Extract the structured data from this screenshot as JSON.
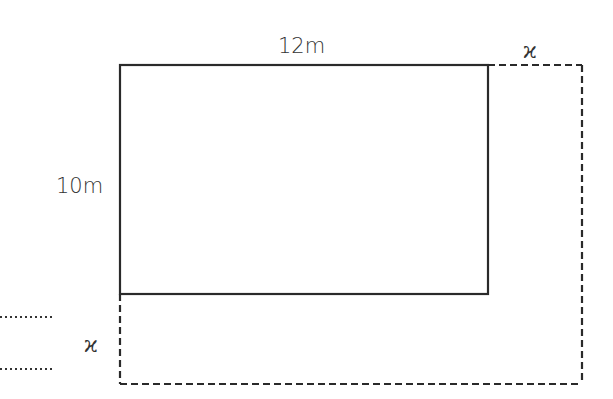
{
  "diagram": {
    "type": "area-expansion-rectangle",
    "inner_rectangle": {
      "width_label": "12m",
      "height_label": "10m",
      "style": "solid",
      "color": "#2a2a2a"
    },
    "outer_rectangle": {
      "style": "dashed",
      "color": "#2a2a2a"
    },
    "extension_labels": {
      "top_right": "ϰ",
      "left_bottom": "ϰ"
    },
    "answer_lines": [
      {
        "text": "............"
      },
      {
        "text": "............"
      }
    ]
  }
}
